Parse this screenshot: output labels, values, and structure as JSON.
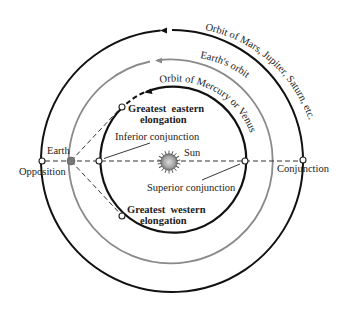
{
  "diagram": {
    "orbits": [
      {
        "id": "outer",
        "label": "Orbit of Mars, Jupiter, Saturn, etc.",
        "color": "#111111"
      },
      {
        "id": "earth",
        "label": "Earth's orbit",
        "color": "#808080"
      },
      {
        "id": "inner",
        "label": "Orbit of Mercury or Venus",
        "color": "#111111"
      }
    ],
    "bodies": {
      "sun": "Sun",
      "earth": "Earth"
    },
    "positions": {
      "opposition": "Opposition",
      "conjunction": "Conjunction",
      "inferior_conjunction": "Inferior conjunction",
      "superior_conjunction": "Superior conjunction",
      "greatest_eastern_line1": "Greatest  eastern",
      "greatest_eastern_line2": "elongation",
      "greatest_western_line1": "Greatest  western",
      "greatest_western_line2": "elongation"
    },
    "colors": {
      "sun_fill": "#a8a8a8",
      "sun_center": "#d9d9d9",
      "earth_fill": "#7a7a7a",
      "dashed_line": "#333333"
    }
  }
}
